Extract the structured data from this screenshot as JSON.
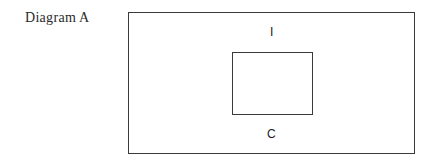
{
  "diagram": {
    "caption": "Diagram A",
    "outer_box_label": "I",
    "inner_box_label": "C",
    "outer_box": {
      "x": 128,
      "y": 12,
      "width": 287,
      "height": 142
    },
    "inner_box": {
      "x": 232,
      "y": 52,
      "width": 81,
      "height": 63
    },
    "line_color": "#3a3a3a"
  }
}
